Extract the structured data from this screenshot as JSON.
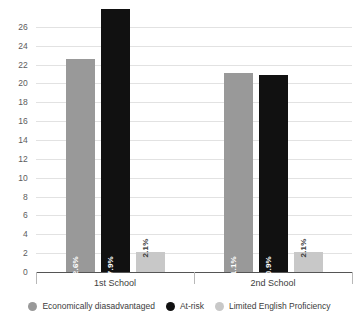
{
  "chart_data": {
    "type": "bar",
    "title": "",
    "subtitle": "",
    "xlabel": "",
    "ylabel": "",
    "categories": [
      "1st School",
      "2nd School"
    ],
    "series": [
      {
        "name": "Economically diasadvantaged",
        "color": "#999999",
        "values": [
          22.6,
          21.1
        ],
        "labels": [
          "22.6%",
          "21.1%"
        ]
      },
      {
        "name": "At-risk",
        "color": "#111111",
        "values": [
          27.9,
          20.9
        ],
        "labels": [
          "27.9%",
          "20.9%"
        ]
      },
      {
        "name": "Limited English Proficiency",
        "color": "#c8c8c8",
        "values": [
          2.1,
          2.1
        ],
        "labels": [
          "2.1%",
          "2.1%"
        ]
      }
    ],
    "ylim": [
      0,
      28
    ],
    "ytick_step": 2,
    "yticks": [
      0,
      2,
      4,
      6,
      8,
      10,
      12,
      14,
      16,
      18,
      20,
      22,
      24,
      26
    ],
    "ytick_labels": [
      "0",
      "2",
      "4",
      "6",
      "8",
      "10",
      "12",
      "14",
      "16",
      "18",
      "20",
      "22",
      "24",
      "26"
    ],
    "grid": true,
    "grid_color": "#e2e2e2",
    "axis_color": "#555555",
    "legend_position": "bottom",
    "background": "#ffffff"
  },
  "legend": {
    "items": [
      {
        "label": "Economically diasadvantaged",
        "color": "#999999"
      },
      {
        "label": "At-risk",
        "color": "#111111"
      },
      {
        "label": "Limited English Proficiency",
        "color": "#c8c8c8"
      }
    ]
  }
}
